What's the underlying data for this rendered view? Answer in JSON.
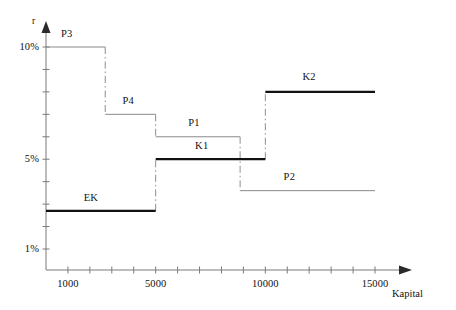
{
  "chart_data": {
    "type": "line",
    "title": "",
    "subtitle": "",
    "xlabel": "Kapital",
    "ylabel": "r",
    "xlim": [
      0,
      16200
    ],
    "ylim": [
      0,
      11.6
    ],
    "grid": false,
    "legend_position": "inline-annotations",
    "x_ticks": [
      {
        "value": 1000,
        "label": "1000"
      },
      {
        "value": 2000,
        "label": ""
      },
      {
        "value": 3000,
        "label": ""
      },
      {
        "value": 4000,
        "label": ""
      },
      {
        "value": 5000,
        "label": "5000"
      },
      {
        "value": 6000,
        "label": ""
      },
      {
        "value": 7000,
        "label": ""
      },
      {
        "value": 8000,
        "label": ""
      },
      {
        "value": 9000,
        "label": ""
      },
      {
        "value": 10000,
        "label": "10000"
      },
      {
        "value": 11000,
        "label": ""
      },
      {
        "value": 12000,
        "label": ""
      },
      {
        "value": 13000,
        "label": ""
      },
      {
        "value": 14000,
        "label": ""
      },
      {
        "value": 15000,
        "label": "15000"
      }
    ],
    "y_ticks": [
      {
        "value": 1,
        "label": "1%"
      },
      {
        "value": 2,
        "label": ""
      },
      {
        "value": 3,
        "label": ""
      },
      {
        "value": 4,
        "label": ""
      },
      {
        "value": 5,
        "label": "5%"
      },
      {
        "value": 6,
        "label": ""
      },
      {
        "value": 7,
        "label": ""
      },
      {
        "value": 8,
        "label": ""
      },
      {
        "value": 9,
        "label": ""
      },
      {
        "value": 10,
        "label": "10%"
      }
    ],
    "series": [
      {
        "name": "P3",
        "label": "P3",
        "style": "thin",
        "rate": 10,
        "x_start": 0,
        "x_end": 2700,
        "label_x": 950,
        "label_y": 10.55
      },
      {
        "name": "P4",
        "label": "P4",
        "style": "thin",
        "rate": 7,
        "x_start": 2700,
        "x_end": 5000,
        "label_x": 3750,
        "label_y": 7.55
      },
      {
        "name": "P1",
        "label": "P1",
        "style": "thin",
        "rate": 6,
        "x_start": 5000,
        "x_end": 8850,
        "label_x": 6750,
        "label_y": 6.55
      },
      {
        "name": "K1",
        "label": "K1",
        "style": "thick",
        "rate": 5,
        "x_start": 5000,
        "x_end": 10000,
        "label_x": 7100,
        "label_y": 5.55
      },
      {
        "name": "P2",
        "label": "P2",
        "style": "thin",
        "rate": 3.6,
        "x_start": 8850,
        "x_end": 15000,
        "label_x": 11100,
        "label_y": 4.15
      },
      {
        "name": "K2",
        "label": "K2",
        "style": "thick",
        "rate": 8,
        "x_start": 10000,
        "x_end": 15000,
        "label_x": 12000,
        "label_y": 8.6
      },
      {
        "name": "EK",
        "label": "EK",
        "style": "thick",
        "rate": 2.7,
        "x_start": 0,
        "x_end": 5000,
        "label_x": 2050,
        "label_y": 3.25
      }
    ],
    "connectors": [
      {
        "name": "P3-to-P4",
        "x": 2700,
        "y_from": 10,
        "y_to": 7,
        "style": "dash-dot"
      },
      {
        "name": "P4-to-P1",
        "x": 5000,
        "y_from": 7,
        "y_to": 6,
        "style": "dash-dot"
      },
      {
        "name": "EK-to-K1",
        "x": 5000,
        "y_from": 2.7,
        "y_to": 5,
        "style": "dash-dot"
      },
      {
        "name": "P1-to-P2",
        "x": 8850,
        "y_from": 6,
        "y_to": 3.6,
        "style": "dash-dot"
      },
      {
        "name": "K1-to-K2",
        "x": 10000,
        "y_from": 5,
        "y_to": 8,
        "style": "dash-dot"
      }
    ]
  }
}
